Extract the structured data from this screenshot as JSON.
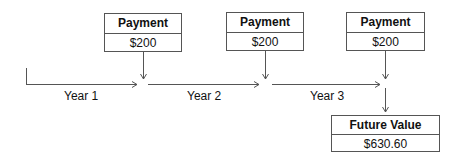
{
  "payments": [
    {
      "title": "Payment",
      "amount": "$200"
    },
    {
      "title": "Payment",
      "amount": "$200"
    },
    {
      "title": "Payment",
      "amount": "$200"
    }
  ],
  "periods": [
    "Year 1",
    "Year 2",
    "Year 3"
  ],
  "result": {
    "title": "Future Value",
    "amount": "$630.60"
  },
  "colors": {
    "line": "#555555",
    "text": "#111111"
  }
}
